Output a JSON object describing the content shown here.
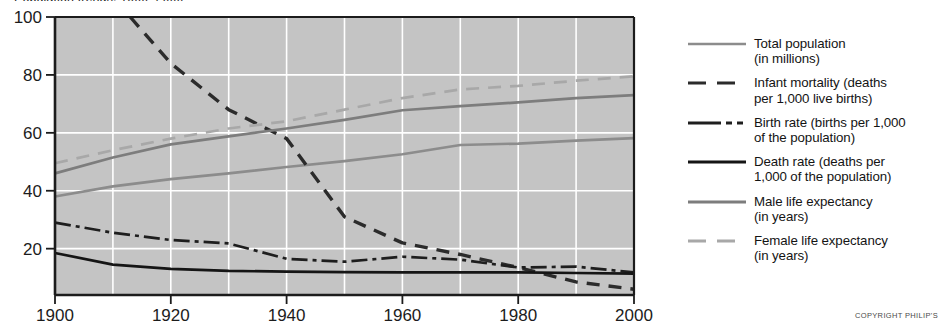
{
  "figure": {
    "cut_off_heading": "Population trends, 1900–2000",
    "copyright": "COPYRIGHT PHILIP'S"
  },
  "colors": {
    "plot_background": "#c4c4c4",
    "gridline": "#ffffff",
    "axis": "#1c1c1c",
    "total_population": "#8c8c8c",
    "infant_mortality": "#2b2b2b",
    "birth_rate": "#1e1e1e",
    "death_rate": "#151515",
    "male_life_expectancy": "#7d7d7d",
    "female_life_expectancy": "#a8a8a8"
  },
  "legend": {
    "items": [
      {
        "name": "total-population",
        "style": "solid",
        "color": "#8c8c8c",
        "line1": "Total population",
        "line2": "(in millions)"
      },
      {
        "name": "infant-mortality",
        "style": "dashed",
        "color": "#2b2b2b",
        "line1": "Infant mortality (deaths",
        "line2": "per 1,000 live births)"
      },
      {
        "name": "birth-rate",
        "style": "dashdot",
        "color": "#1e1e1e",
        "line1": "Birth rate (births per 1,000",
        "line2": "of the population)"
      },
      {
        "name": "death-rate",
        "style": "solid",
        "color": "#151515",
        "line1": "Death rate (deaths per",
        "line2": "1,000 of the population)"
      },
      {
        "name": "male-life-expectancy",
        "style": "solid",
        "color": "#7d7d7d",
        "line1": "Male life expectancy",
        "line2": "(in years)"
      },
      {
        "name": "female-life-expectancy",
        "style": "dashed",
        "color": "#a8a8a8",
        "line1": "Female life expectancy",
        "line2": "(in years)"
      }
    ]
  },
  "chart_data": {
    "type": "line",
    "title": "",
    "xlabel": "",
    "ylabel": "",
    "xlim": [
      1900,
      2000
    ],
    "ylim": [
      4,
      100
    ],
    "grid": true,
    "legend_position": "right",
    "xticks": [
      1900,
      1920,
      1940,
      1960,
      1980,
      2000
    ],
    "xtick_labels": [
      "1900",
      "1920",
      "1940",
      "1960",
      "1980",
      "2000"
    ],
    "xminor_step": 10,
    "yticks": [
      20,
      40,
      60,
      80,
      100
    ],
    "ytick_labels": [
      "20",
      "40",
      "60",
      "80",
      "100"
    ],
    "x": [
      1900,
      1910,
      1920,
      1930,
      1940,
      1950,
      1960,
      1970,
      1980,
      1990,
      2000
    ],
    "series": [
      {
        "name": "Total population (in millions)",
        "key": "total_population",
        "style": "solid",
        "color": "#8c8c8c",
        "values": [
          38.0,
          41.5,
          44.0,
          46.0,
          48.2,
          50.2,
          52.6,
          55.8,
          56.3,
          57.3,
          58.2
        ]
      },
      {
        "name": "Infant mortality (deaths per 1,000 live births)",
        "key": "infant_mortality",
        "style": "dashed",
        "color": "#2b2b2b",
        "x": [
          1913,
          1920,
          1930,
          1940,
          1950,
          1960,
          1970,
          1980,
          1990,
          2000
        ],
        "values": [
          100.0,
          84.0,
          68.0,
          58.0,
          31.0,
          22.0,
          18.0,
          13.5,
          8.5,
          6.0
        ]
      },
      {
        "name": "Birth rate (births per 1,000 of the population)",
        "key": "birth_rate",
        "style": "dashdot",
        "color": "#1e1e1e",
        "values": [
          29.0,
          25.5,
          23.0,
          21.8,
          16.5,
          15.5,
          17.2,
          16.2,
          13.5,
          13.8,
          11.8
        ]
      },
      {
        "name": "Death rate (deaths per 1,000 of the population)",
        "key": "death_rate",
        "style": "solid",
        "color": "#151515",
        "values": [
          18.5,
          14.5,
          13.0,
          12.3,
          12.1,
          11.9,
          11.8,
          11.8,
          11.8,
          11.6,
          11.4
        ]
      },
      {
        "name": "Male life expectancy (in years)",
        "key": "male_life_expectancy",
        "style": "solid",
        "color": "#7d7d7d",
        "values": [
          46.0,
          51.5,
          56.0,
          58.8,
          61.5,
          64.5,
          67.8,
          69.2,
          70.5,
          72.0,
          73.0
        ]
      },
      {
        "name": "Female life expectancy (in years)",
        "key": "female_life_expectancy",
        "style": "dashed",
        "color": "#a8a8a8",
        "values": [
          49.5,
          54.0,
          58.0,
          61.5,
          64.0,
          68.0,
          72.0,
          75.0,
          76.2,
          78.0,
          79.5
        ]
      }
    ]
  }
}
